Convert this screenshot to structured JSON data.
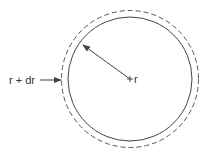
{
  "diagram": {
    "type": "concentric-circles",
    "labels": {
      "outer": "r + dr",
      "inner": "r"
    },
    "colors": {
      "stroke": "#444444",
      "text": "#333333",
      "background": "#ffffff"
    },
    "shapes": {
      "inner_circle": {
        "style": "solid",
        "meaning": "radius r"
      },
      "outer_circle": {
        "style": "dashed",
        "meaning": "radius r + dr"
      },
      "radius_arrow": {
        "from": "center",
        "to": "inner circle"
      },
      "pointer_arrow": {
        "from": "label r + dr",
        "to": "outer circle"
      }
    }
  }
}
